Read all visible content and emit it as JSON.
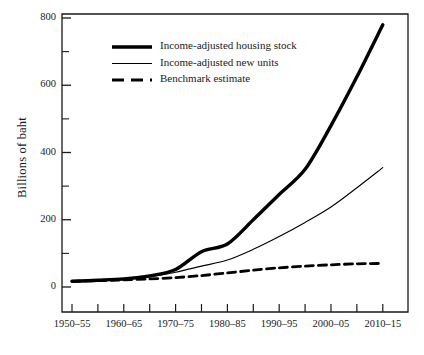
{
  "chart_data": {
    "type": "line",
    "title": "",
    "xlabel": "",
    "ylabel": "Billions of baht",
    "ylim": [
      0,
      800
    ],
    "yticks": [
      0,
      200,
      400,
      600,
      800
    ],
    "yminorticks": [
      100,
      300,
      500,
      700
    ],
    "grid": false,
    "legend_position": "upper-left-inside",
    "categories": [
      "1950–55",
      "1955–60",
      "1960–65",
      "1965–70",
      "1970–75",
      "1975–80",
      "1980–85",
      "1985–90",
      "1990–95",
      "1995–2000",
      "2000–05",
      "2005–10",
      "2010–15"
    ],
    "xticklabels": [
      "1950–55",
      "",
      "1960–65",
      "",
      "1970–75",
      "",
      "1980–85",
      "",
      "1990–95",
      "",
      "2000–05",
      "",
      "2010–15"
    ],
    "series": [
      {
        "name": "Income-adjusted housing stock",
        "style": "thick-solid",
        "color": "#000000",
        "values": [
          17,
          20,
          24,
          33,
          52,
          105,
          128,
          200,
          275,
          350,
          480,
          625,
          780
        ]
      },
      {
        "name": "Income-adjusted new units",
        "style": "thin-solid",
        "color": "#000000",
        "values": [
          15,
          18,
          22,
          30,
          44,
          62,
          80,
          112,
          150,
          192,
          238,
          295,
          355
        ]
      },
      {
        "name": "Benchmark estimate",
        "style": "dashed",
        "color": "#000000",
        "values": [
          17,
          19,
          21,
          24,
          28,
          34,
          42,
          50,
          57,
          62,
          66,
          69,
          70
        ]
      }
    ]
  },
  "axes": {
    "y_axis_label": "Billions of baht",
    "y_tick_labels": [
      "0",
      "200",
      "400",
      "600",
      "800"
    ],
    "x_tick_labels": [
      "1950–55",
      "1960–65",
      "1970–75",
      "1980–85",
      "1990–95",
      "2000–05",
      "2010–15"
    ]
  },
  "legend": {
    "items": [
      {
        "label": "Income-adjusted housing stock",
        "style": "thick-solid"
      },
      {
        "label": "Income-adjusted new units",
        "style": "thin-solid"
      },
      {
        "label": "Benchmark estimate",
        "style": "dashed"
      }
    ]
  }
}
